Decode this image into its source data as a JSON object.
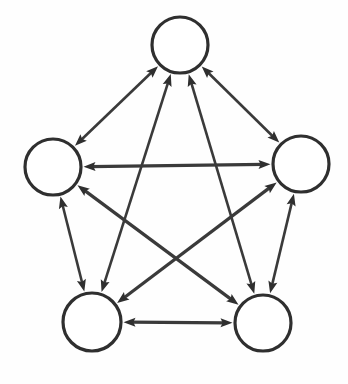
{
  "figure": {
    "kind": "node-link-diagram",
    "width": 348,
    "height": 384,
    "background_color": "#fefefe"
  },
  "style": {
    "node_stroke_color": "#2f2f2f",
    "node_fill_color": "#ffffff",
    "node_stroke_width": 3.2,
    "edge_color": "#3a3a3a",
    "edge_stroke_width": 2.6,
    "edge_stroke_width_thick": 3.2,
    "arrow_color": "#2f2f2f",
    "arrow_length": 12,
    "arrow_half_width": 4.6
  },
  "nodes": [
    {
      "id": "top",
      "label": "",
      "cx": 180,
      "cy": 45,
      "r": 28
    },
    {
      "id": "left",
      "label": "",
      "cx": 53,
      "cy": 167,
      "r": 28
    },
    {
      "id": "right",
      "label": "",
      "cx": 301,
      "cy": 164,
      "r": 28
    },
    {
      "id": "bottom-left",
      "label": "",
      "cx": 92,
      "cy": 322,
      "r": 29
    },
    {
      "id": "bottom-right",
      "label": "",
      "cx": 263,
      "cy": 323,
      "r": 28
    }
  ],
  "edges": [
    {
      "id": "edge-top-left",
      "source": "top",
      "target": "left",
      "directed": "both",
      "weight": "normal"
    },
    {
      "id": "edge-top-right",
      "source": "top",
      "target": "right",
      "directed": "both",
      "weight": "normal"
    },
    {
      "id": "edge-top-bottom-left",
      "source": "top",
      "target": "bottom-left",
      "directed": "both",
      "weight": "normal"
    },
    {
      "id": "edge-top-bottom-right",
      "source": "top",
      "target": "bottom-right",
      "directed": "both",
      "weight": "normal"
    },
    {
      "id": "edge-left-right",
      "source": "left",
      "target": "right",
      "directed": "both",
      "weight": "thick"
    },
    {
      "id": "edge-left-bottom-left",
      "source": "left",
      "target": "bottom-left",
      "directed": "both",
      "weight": "normal"
    },
    {
      "id": "edge-left-bottom-right",
      "source": "left",
      "target": "bottom-right",
      "directed": "both",
      "weight": "thick"
    },
    {
      "id": "edge-right-bottom-left",
      "source": "right",
      "target": "bottom-left",
      "directed": "both",
      "weight": "thick"
    },
    {
      "id": "edge-right-bottom-right",
      "source": "right",
      "target": "bottom-right",
      "directed": "both",
      "weight": "normal"
    },
    {
      "id": "edge-bottom-left-bottom-right",
      "source": "bottom-left",
      "target": "bottom-right",
      "directed": "both",
      "weight": "thick"
    }
  ],
  "counts": {
    "node_count": 5,
    "edge_count": 10
  }
}
